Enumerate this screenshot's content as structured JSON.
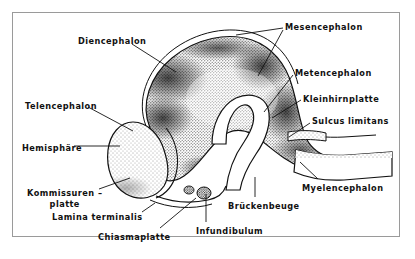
{
  "figure": {
    "frame_color": "#9a9a9a",
    "background_color": "#ffffff",
    "ink_color": "#111111",
    "style": "stippled line engraving"
  },
  "labels": [
    {
      "id": "diencephalon",
      "text": "Diencephalon",
      "x": 78,
      "y": 36,
      "align": "left"
    },
    {
      "id": "mesencephalon",
      "text": "Mesencephalon",
      "x": 285,
      "y": 22,
      "align": "left"
    },
    {
      "id": "metencephalon",
      "text": "Metencephalon",
      "x": 295,
      "y": 68,
      "align": "left"
    },
    {
      "id": "kleinhirnplatte",
      "text": "Kleinhirnplatte",
      "x": 303,
      "y": 94,
      "align": "left"
    },
    {
      "id": "sulcus-limitans",
      "text": "Sulcus limitans",
      "x": 312,
      "y": 116,
      "align": "left"
    },
    {
      "id": "telencephalon",
      "text": "Telencephalon",
      "x": 25,
      "y": 101,
      "align": "left"
    },
    {
      "id": "hemisphaere",
      "text": "Hemisphäre",
      "x": 22,
      "y": 143,
      "align": "left"
    },
    {
      "id": "kommissurenplatte",
      "text": "Kommissuren –",
      "text2": "platte",
      "x": 27,
      "y": 188,
      "align": "center"
    },
    {
      "id": "lamina-terminalis",
      "text": "Lamina terminalis",
      "x": 52,
      "y": 212,
      "align": "left"
    },
    {
      "id": "chiasmaplatte",
      "text": "Chiasmaplatte",
      "x": 98,
      "y": 232,
      "align": "left"
    },
    {
      "id": "infundibulum",
      "text": "Infundibulum",
      "x": 196,
      "y": 226,
      "align": "left"
    },
    {
      "id": "brueckenbeuge",
      "text": "Brückenbeuge",
      "x": 228,
      "y": 201,
      "align": "left"
    },
    {
      "id": "myelencephalon",
      "text": "Myelencephalon",
      "x": 302,
      "y": 183,
      "align": "left"
    }
  ],
  "leaders": [
    {
      "id": "leader-diencephalon",
      "points": "132,44 176,72"
    },
    {
      "id": "leader-mesencephalon-a",
      "points": "283,28 236,35"
    },
    {
      "id": "leader-mesencephalon-b",
      "points": "283,30 258,76"
    },
    {
      "id": "leader-metencephalon",
      "points": "293,75 264,112"
    },
    {
      "id": "leader-kleinhirnplatte",
      "points": "301,100 272,118"
    },
    {
      "id": "leader-sulcus-limitans",
      "points": "310,123 289,137"
    },
    {
      "id": "leader-telencephalon",
      "points": "88,107 133,131"
    },
    {
      "id": "leader-hemisphaere",
      "points": "74,146 120,146"
    },
    {
      "id": "leader-kommissurenplatte",
      "points": "99,189 130,178"
    },
    {
      "id": "leader-lamina-terminalis",
      "points": "142,212 155,203"
    },
    {
      "id": "leader-chiasmaplatte",
      "points": "160,228 196,198"
    },
    {
      "id": "leader-infundibulum",
      "points": "206,222 206,194"
    },
    {
      "id": "leader-brueckenbeuge",
      "points": "255,197 255,177"
    },
    {
      "id": "leader-myelencephalon",
      "points": "318,179 300,162"
    }
  ]
}
